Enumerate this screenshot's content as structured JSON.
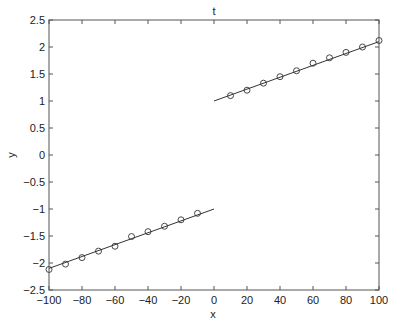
{
  "chart_data": {
    "type": "line",
    "title": "t",
    "xlabel": "x",
    "ylabel": "y",
    "xlim": [
      -100,
      100
    ],
    "ylim": [
      -2.5,
      2.5
    ],
    "grid": false,
    "legend": null,
    "x_ticks": [
      -100,
      -80,
      -60,
      -40,
      -20,
      0,
      20,
      40,
      60,
      80,
      100
    ],
    "y_ticks": [
      -2.5,
      -2,
      -1.5,
      -1,
      -0.5,
      0,
      0.5,
      1,
      1.5,
      2,
      2.5
    ],
    "x_tick_labels": [
      "-100",
      "-80",
      "-60",
      "-40",
      "-20",
      "0",
      "20",
      "40",
      "60",
      "80",
      "100"
    ],
    "y_tick_labels": [
      "-2.5",
      "-2",
      "-1.5",
      "-1",
      "-0.5",
      "0",
      "0.5",
      "1",
      "1.5",
      "2",
      "2.5"
    ],
    "series": [
      {
        "name": "fit-left",
        "style": "line",
        "x": [
          -100,
          0
        ],
        "y": [
          -2.1,
          -1.0
        ]
      },
      {
        "name": "fit-right",
        "style": "line",
        "x": [
          0,
          100
        ],
        "y": [
          1.0,
          2.1
        ]
      },
      {
        "name": "samples-left",
        "style": "markers-circle",
        "x": [
          -100,
          -90,
          -80,
          -70,
          -60,
          -50,
          -40,
          -30,
          -20,
          -10
        ],
        "y": [
          -2.12,
          -2.02,
          -1.9,
          -1.78,
          -1.69,
          -1.51,
          -1.42,
          -1.32,
          -1.2,
          -1.08
        ]
      },
      {
        "name": "samples-right",
        "style": "markers-circle",
        "x": [
          10,
          20,
          30,
          40,
          50,
          60,
          70,
          80,
          90,
          100
        ],
        "y": [
          1.1,
          1.2,
          1.33,
          1.45,
          1.56,
          1.7,
          1.8,
          1.9,
          2.0,
          2.12
        ]
      }
    ],
    "colors": {
      "line": "#333333",
      "marker": "#333333",
      "axes": "#555555"
    }
  }
}
